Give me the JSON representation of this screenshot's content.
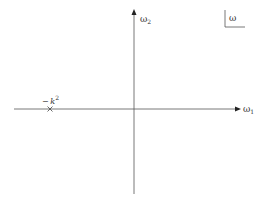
{
  "diagram": {
    "type": "complex-plane",
    "plane_label": "ω",
    "axes": {
      "horizontal": {
        "symbol": "ω",
        "subscript": "1"
      },
      "vertical": {
        "symbol": "ω",
        "subscript": "2"
      }
    },
    "points": [
      {
        "marker": "cross",
        "label_prefix": "−",
        "label_var": "k",
        "label_exp": "2"
      }
    ],
    "colors": {
      "line": "#555555",
      "text": "#333333",
      "background": "#ffffff"
    }
  }
}
